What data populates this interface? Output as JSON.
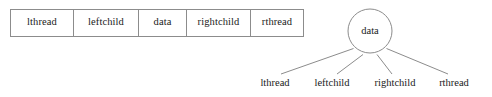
{
  "figure": {
    "stroke_color": "#8c8c8c",
    "text_color": "#1a1a1a",
    "background_color": "#ffffff"
  },
  "node_record": {
    "fields": [
      {
        "label": "lthread"
      },
      {
        "label": "leftchild"
      },
      {
        "label": "data"
      },
      {
        "label": "rightchild"
      },
      {
        "label": "rthread"
      }
    ]
  },
  "tree_node": {
    "circle_label": "data",
    "leaf_labels": [
      {
        "label": "lthread"
      },
      {
        "label": "leftchild"
      },
      {
        "label": "rightchild"
      },
      {
        "label": "rthread"
      }
    ]
  }
}
